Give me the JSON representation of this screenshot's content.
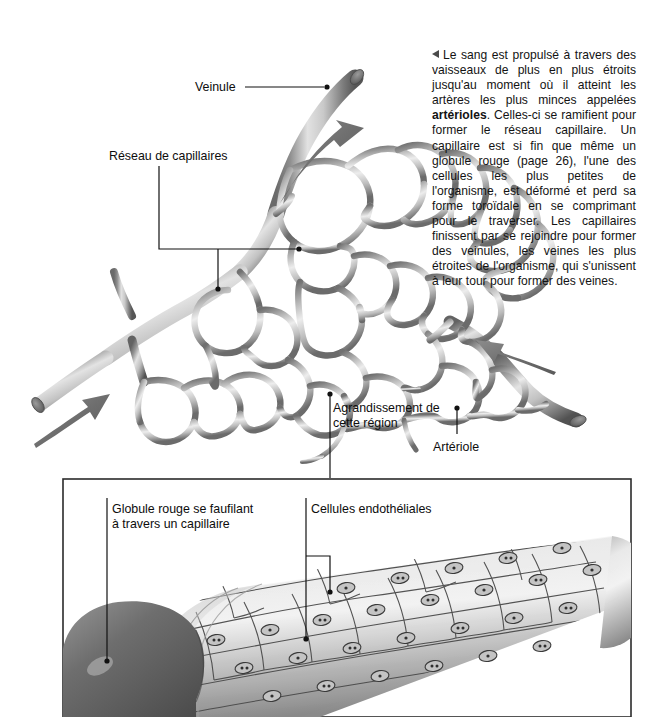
{
  "page": {
    "width": 666,
    "height": 717,
    "background": "#ffffff",
    "domain": "diagram"
  },
  "body_text": {
    "marker_icon": "left-triangle-icon",
    "paragraph_html": "Le sang est propulsé à travers des vaisseaux de plus en plus étroits jusqu'au moment où il atteint les artères les plus minces appelées <b>artérioles</b>. Celles-ci se ramifient pour former le réseau capillaire. Un capillaire est si fin que même un globule rouge (page 26), l'une des cellules les plus petites de l'organisme, est déformé et perd sa forme toroïdale en se comprimant pour le traverser. Les capillaires finissent par se rejoindre pour former des veinules, les veines les plus étroites de l'organisme, qui s'unissent à leur tour pour former des veines.",
    "bold_term": "artérioles",
    "page_reference": "page 26"
  },
  "labels": {
    "veinule": "Veinule",
    "reseau_de_capillaires": "Réseau de capillaires",
    "agrandissement": "Agrandissement de\ncette région",
    "arteriole": "Artériole",
    "globule_rouge": "Globule rouge se faufilant\nà travers un capillaire",
    "cellules_endotheliales": "Cellules endothéliales"
  },
  "colors": {
    "vessel_light": "#e8e8e8",
    "vessel_mid": "#9a9a9a",
    "vessel_dark": "#4a4a4a",
    "arrow": "#6f6f6f",
    "leader_line": "#111111",
    "frame": "#2b2b2b",
    "text": "#0d0d0d",
    "rbc_dark": "#5d5d5d",
    "rbc_mid": "#7d7d7d",
    "cell_fill": "#d9d9d9",
    "cell_outline": "#3a3a3a"
  },
  "diagram_top": {
    "name": "capillary-network-diagram",
    "flow_arrows": [
      {
        "name": "venule-outflow-arrow",
        "direction": "up-right"
      },
      {
        "name": "arteriole-inflow-arrow",
        "direction": "up-left"
      },
      {
        "name": "artery-flow-arrow",
        "direction": "up-right"
      }
    ],
    "leader_dots": 5
  },
  "diagram_bottom": {
    "name": "capillary-cross-section-panel",
    "frame": {
      "x": 62,
      "y": 478,
      "width": 570,
      "height": 239
    },
    "elements": [
      "red-blood-cell",
      "endothelial-cell-layer",
      "capillary-tube"
    ]
  }
}
